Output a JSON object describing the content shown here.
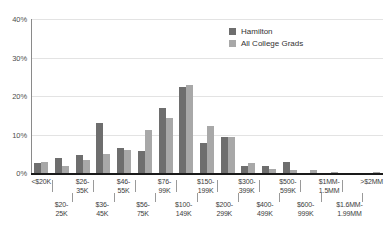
{
  "chart_data": {
    "type": "bar",
    "title": "",
    "subtitle": "",
    "xlabel": "",
    "ylabel": "",
    "ylim": [
      0,
      40
    ],
    "yticks": [
      0,
      10,
      20,
      30,
      40
    ],
    "ytick_labels": [
      "0%",
      "10%",
      "20%",
      "30%",
      "40%"
    ],
    "grid": true,
    "legend_position": "top-right",
    "value_unit": "%",
    "categories": [
      "<$20K",
      "$20-25K",
      "$26-35K",
      "$36-45K",
      "$46-55K",
      "$56-75K",
      "$76-99K",
      "$100-149K",
      "$150-199K",
      "$200-299K",
      "$300-399K",
      "$400-499K",
      "$500-599K",
      "$600-999K",
      "$1MM-1.5MM",
      "$1.6MM-1.99MM",
      ">$2MM"
    ],
    "category_lines": [
      [
        "<$20K",
        ""
      ],
      [
        "$20-",
        "25K"
      ],
      [
        "$26-",
        "35K"
      ],
      [
        "$36-",
        "45K"
      ],
      [
        "$46-",
        "55K"
      ],
      [
        "$56-",
        "75K"
      ],
      [
        "$76-",
        "99K"
      ],
      [
        "$100-",
        "149K"
      ],
      [
        "$150-",
        "199K"
      ],
      [
        "$200-",
        "299K"
      ],
      [
        "$300-",
        "399K"
      ],
      [
        "$400-",
        "499K"
      ],
      [
        "$500-",
        "599K"
      ],
      [
        "$600-",
        "999K"
      ],
      [
        "$1MM-",
        "1.5MM"
      ],
      [
        "$1.6MM-",
        "1.99MM"
      ],
      [
        ">$2MM",
        ""
      ]
    ],
    "series": [
      {
        "name": "Hamilton",
        "color": "#6e6e6e",
        "values": [
          2.6,
          3.8,
          4.6,
          13.1,
          6.6,
          5.7,
          17.0,
          22.4,
          7.7,
          9.4,
          1.9,
          1.8,
          2.8,
          0.1,
          0.1,
          0.0,
          0.1
        ]
      },
      {
        "name": "All College Grads",
        "color": "#a8a8a8",
        "values": [
          2.8,
          1.7,
          3.5,
          4.9,
          5.9,
          11.1,
          14.4,
          22.8,
          12.1,
          9.3,
          2.6,
          1.1,
          0.7,
          0.7,
          0.3,
          0.0,
          0.2
        ]
      }
    ]
  },
  "legend": {
    "items": [
      {
        "label": "Hamilton"
      },
      {
        "label": "All College Grads"
      }
    ]
  }
}
